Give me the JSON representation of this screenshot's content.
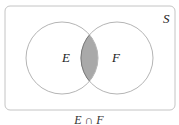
{
  "diagram": {
    "type": "venn",
    "universe_label": "S",
    "sets": [
      {
        "label": "E"
      },
      {
        "label": "F"
      }
    ],
    "shaded_region": "intersection",
    "caption": "E ∩ F",
    "colors": {
      "outline": "#bdbdbd",
      "shade": "#a9a9a9",
      "shade_outline": "#666666",
      "background": "#ffffff"
    }
  }
}
